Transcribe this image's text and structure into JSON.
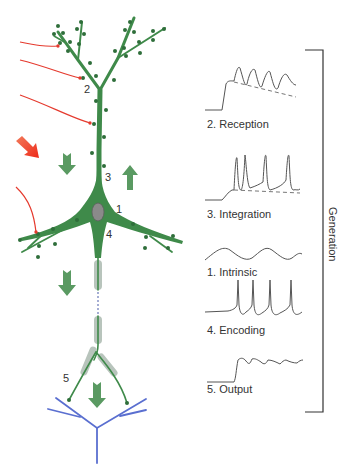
{
  "diagram": {
    "type": "neuron-signal-generation",
    "colors": {
      "neuron": "#3f8a4a",
      "neuron_dark": "#2f6e3a",
      "soma_nucleus": "#8a8a8a",
      "myelin": "#b8c4bc",
      "target_dendrite": "#5a6fd0",
      "input_arrow": "#e53a2e",
      "flow_arrow": "#5a9a62",
      "waveform": "#555555",
      "bracket": "#333333"
    },
    "neuron_labels": {
      "n1": "1",
      "n2": "2",
      "n3": "3",
      "n4": "4",
      "n5": "5"
    },
    "waveforms": [
      {
        "id": "reception",
        "label": "2. Reception",
        "icon": "epsp-oscillation-waveform"
      },
      {
        "id": "integration",
        "label": "3. Integration",
        "icon": "spike-train-waveform"
      },
      {
        "id": "intrinsic",
        "label": "1. Intrinsic",
        "icon": "sine-oscillation-waveform"
      },
      {
        "id": "encoding",
        "label": "4. Encoding",
        "icon": "action-potential-waveform"
      },
      {
        "id": "output",
        "label": "5. Output",
        "icon": "synaptic-output-waveform"
      }
    ],
    "bracket_label": "Generation"
  }
}
